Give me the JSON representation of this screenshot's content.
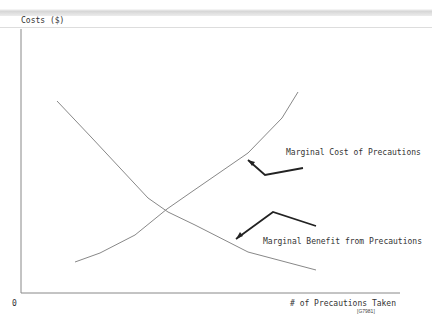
{
  "chart_data": {
    "type": "line",
    "title": "",
    "ylabel": "Costs ($)",
    "xlabel": "# of Precautions Taken",
    "origin_label": "0",
    "figure_id": "[G7981]",
    "grid": false,
    "series": [
      {
        "name": "Marginal Cost of Precautions",
        "points": [
          [
            75,
            262
          ],
          [
            100,
            253
          ],
          [
            135,
            235
          ],
          [
            167,
            209
          ],
          [
            190,
            193
          ],
          [
            248,
            153
          ],
          [
            282,
            118
          ],
          [
            298,
            92
          ]
        ]
      },
      {
        "name": "Marginal Benefit from Precautions",
        "points": [
          [
            57,
            101
          ],
          [
            92,
            138
          ],
          [
            148,
            198
          ],
          [
            168,
            212
          ],
          [
            195,
            225
          ],
          [
            248,
            252
          ],
          [
            316,
            270
          ]
        ]
      }
    ],
    "annotations": [
      {
        "text": "Marginal Cost of Precautions",
        "arrow": [
          [
            303,
            168
          ],
          [
            265,
            175
          ],
          [
            248,
            160
          ]
        ]
      },
      {
        "text": "Marginal Benefit from Precautions",
        "arrow": [
          [
            316,
            226
          ],
          [
            273,
            212
          ],
          [
            236,
            239
          ]
        ]
      }
    ]
  }
}
